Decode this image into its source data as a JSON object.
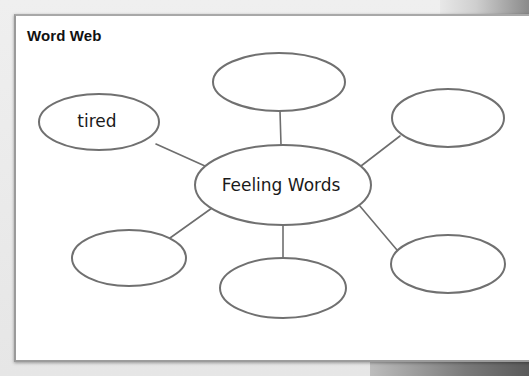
{
  "worksheet": {
    "title": "Word Web",
    "center_node": {
      "label": "Feeling Words"
    },
    "nodes": [
      {
        "id": "top",
        "label": ""
      },
      {
        "id": "upper-left",
        "label": "tired"
      },
      {
        "id": "upper-right",
        "label": ""
      },
      {
        "id": "lower-left",
        "label": ""
      },
      {
        "id": "bottom",
        "label": ""
      },
      {
        "id": "lower-right",
        "label": ""
      }
    ]
  },
  "colors": {
    "card_background": "#ffffff",
    "outline": "#6e6e6e",
    "text": "#1a1a1a"
  }
}
